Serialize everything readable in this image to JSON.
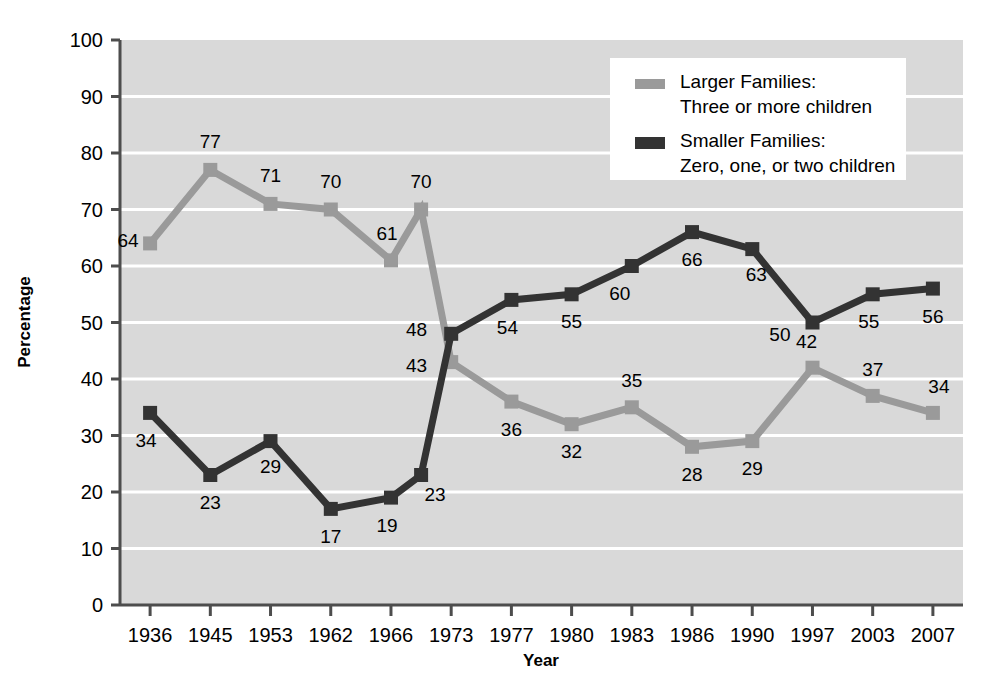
{
  "chart_data": {
    "type": "line",
    "title": "",
    "xlabel": "Year",
    "ylabel": "Percentage",
    "ylim": [
      0,
      100
    ],
    "ytick_step": 10,
    "yticks": [
      "0",
      "10",
      "20",
      "30",
      "40",
      "50",
      "60",
      "70",
      "80",
      "90",
      "100"
    ],
    "categories": [
      "1936",
      "1945",
      "1953",
      "1962",
      "1966",
      "",
      "1973",
      "1977",
      "1980",
      "1983",
      "1986",
      "1990",
      "1997",
      "2003",
      "2007"
    ],
    "tick_labels": [
      "1936",
      "1945",
      "1953",
      "1962",
      "1966",
      "1973",
      "1977",
      "1980",
      "1983",
      "1986",
      "1990",
      "1997",
      "2003",
      "2007"
    ],
    "grid": true,
    "grid_axis": "y",
    "legend_position": "top-right",
    "series": [
      {
        "name": "Larger Families: Three or more children",
        "color": "#9a9a9a",
        "values": [
          64,
          77,
          71,
          70,
          61,
          70,
          43,
          36,
          32,
          35,
          28,
          29,
          42,
          37,
          34
        ],
        "labels": [
          "64",
          "77",
          "71",
          "70",
          "61",
          "70",
          "43",
          "36",
          "32",
          "35",
          "28",
          "29",
          "42",
          "37",
          "34"
        ]
      },
      {
        "name": "Smaller Families: Zero, one, or two children",
        "color": "#333333",
        "values": [
          34,
          23,
          29,
          17,
          19,
          23,
          48,
          54,
          55,
          60,
          66,
          63,
          50,
          55,
          56
        ],
        "labels": [
          "34",
          "23",
          "29",
          "17",
          "19",
          "23",
          "48",
          "54",
          "55",
          "60",
          "66",
          "63",
          "50",
          "55",
          "56"
        ]
      }
    ]
  },
  "legend": {
    "entries": [
      {
        "line1": "Larger Families:",
        "line2": "Three or more children",
        "swatch_color": "#9a9a9a"
      },
      {
        "line1": "Smaller Families:",
        "line2": "Zero, one, or two children",
        "swatch_color": "#333333"
      }
    ]
  },
  "axes": {
    "y_axis_title": "Percentage",
    "x_axis_title": "Year"
  },
  "colors": {
    "plot_background": "#d9d9d9",
    "gridline": "#ffffff",
    "axis": "#4d4d4d",
    "larger_families": "#9a9a9a",
    "smaller_families": "#333333"
  }
}
